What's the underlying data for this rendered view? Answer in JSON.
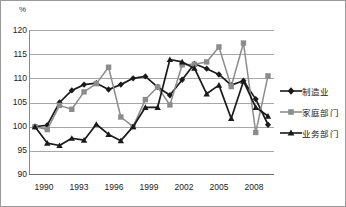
{
  "chart_data": {
    "type": "line",
    "title": "",
    "subtitle": "",
    "xlabel": "",
    "ylabel": "%",
    "unit_label": "%",
    "grid": true,
    "legend_position": "right",
    "xlim": [
      1990,
      2009
    ],
    "ylim": [
      90,
      120
    ],
    "ytick_step": 5,
    "yticks": [
      "120",
      "115",
      "110",
      "105",
      "100",
      "95",
      "90"
    ],
    "ytick_values": [
      120,
      115,
      110,
      105,
      100,
      95,
      90
    ],
    "xticks": [
      "1990",
      "1993",
      "1996",
      "1999",
      "2002",
      "2005",
      "2008"
    ],
    "xtick_values": [
      1990,
      1993,
      1996,
      1999,
      2002,
      2005,
      2008
    ],
    "x": [
      1990,
      1991,
      1992,
      1993,
      1994,
      1995,
      1996,
      1997,
      1998,
      1999,
      2000,
      2001,
      2002,
      2003,
      2004,
      2005,
      2006,
      2007,
      2008,
      2009
    ],
    "series": [
      {
        "name": "制造业",
        "marker": "diamond",
        "color": "#1a1a1a",
        "values": [
          100.0,
          100.3,
          105.0,
          107.5,
          108.7,
          109.0,
          107.7,
          108.7,
          110.0,
          110.4,
          108.2,
          106.5,
          109.7,
          113.0,
          112.0,
          110.8,
          108.6,
          109.5,
          105.7,
          100.4
        ]
      },
      {
        "name": "家庭部门",
        "marker": "square",
        "color": "#8c8c8c",
        "values": [
          100.0,
          99.4,
          104.4,
          103.6,
          107.2,
          108.9,
          112.3,
          102.0,
          100.0,
          105.6,
          108.2,
          104.5,
          112.8,
          112.9,
          113.4,
          116.5,
          108.3,
          117.3,
          98.8,
          110.5
        ]
      },
      {
        "name": "业务部门",
        "marker": "triangle",
        "color": "#1a1a1a",
        "values": [
          100.0,
          96.6,
          96.1,
          97.6,
          97.2,
          100.5,
          98.4,
          97.1,
          100.0,
          104.0,
          104.0,
          113.9,
          113.4,
          112.1,
          106.8,
          108.6,
          101.7,
          109.4,
          104.0,
          102.2
        ]
      }
    ]
  },
  "legend": {
    "items": [
      {
        "label": "制造业",
        "marker": "diamond",
        "color": "#1a1a1a"
      },
      {
        "label": "家庭部门",
        "marker": "square",
        "color": "#8c8c8c"
      },
      {
        "label": "业务部门",
        "marker": "triangle",
        "color": "#1a1a1a"
      }
    ]
  }
}
